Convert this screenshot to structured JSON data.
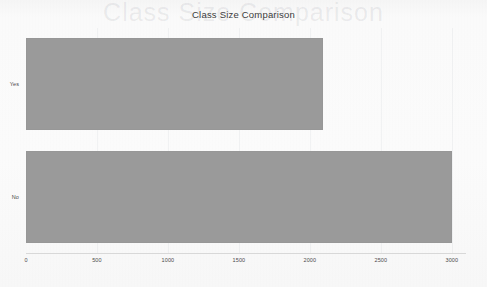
{
  "chart_data": {
    "type": "bar",
    "orientation": "horizontal",
    "title": "Class Size Comparison",
    "xlabel": "",
    "ylabel": "",
    "categories": [
      "Yes",
      "No"
    ],
    "values": [
      2090,
      3000
    ],
    "series": [
      {
        "name": "Class Size",
        "values": [
          2090,
          3000
        ]
      }
    ],
    "xticks": [
      0,
      500,
      1000,
      1500,
      2000,
      2500,
      3000
    ],
    "xtick_labels": [
      "0",
      "500",
      "1000",
      "1500",
      "2000",
      "2500",
      "3000"
    ],
    "ytick_labels": [
      "Yes",
      "No"
    ],
    "xlim": [
      0,
      3100
    ],
    "grid": false,
    "legend": null,
    "bar_color": "#9a9a9a",
    "background_color": "#fbfbfb",
    "title_color": "#3b3b3b",
    "tick_color": "#4a4a4a"
  },
  "watermark": {
    "ghost_title": "Class Size Comparison"
  }
}
